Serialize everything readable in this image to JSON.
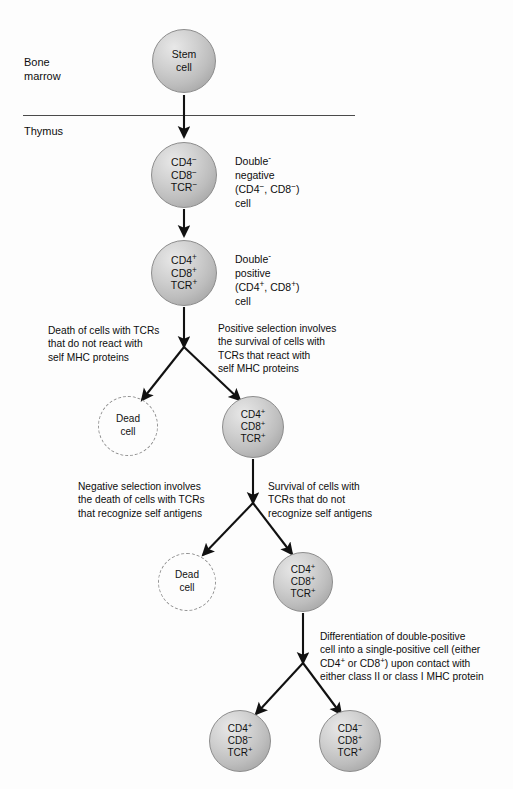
{
  "diagram": {
    "regions": [
      {
        "name": "bone-marrow",
        "label": "Bone\nmarrow"
      },
      {
        "name": "thymus",
        "label": "Thymus"
      }
    ],
    "cells": [
      {
        "id": "stem-cell",
        "name": "stem-cell",
        "type": "sphere",
        "lines": [
          "Stem",
          "cell"
        ],
        "cx": 184,
        "cy": 61,
        "r": 32,
        "font": 10.5
      },
      {
        "id": "double-negative",
        "name": "double-negative-cell",
        "type": "sphere",
        "lines": [
          "CD4−",
          "CD8−",
          "TCR−"
        ],
        "cx": 184,
        "cy": 175,
        "r": 33,
        "font": 10.5
      },
      {
        "id": "double-positive",
        "name": "double-positive-cell",
        "type": "sphere",
        "lines": [
          "CD4+",
          "CD8+",
          "TCR+"
        ],
        "cx": 184,
        "cy": 273,
        "r": 33,
        "font": 10.5
      },
      {
        "id": "dead-cell-1",
        "name": "dead-cell-positive-selection",
        "type": "dashed",
        "lines": [
          "Dead",
          "cell"
        ],
        "cx": 128,
        "cy": 426,
        "r": 30,
        "font": 10
      },
      {
        "id": "surviving-dp-1",
        "name": "surviving-double-positive-cell-1",
        "type": "sphere",
        "lines": [
          "CD4+",
          "CD8+",
          "TCR+"
        ],
        "cx": 253,
        "cy": 427,
        "r": 31,
        "font": 10
      },
      {
        "id": "dead-cell-2",
        "name": "dead-cell-negative-selection",
        "type": "dashed",
        "lines": [
          "Dead",
          "cell"
        ],
        "cx": 187,
        "cy": 582,
        "r": 29,
        "font": 10
      },
      {
        "id": "surviving-dp-2",
        "name": "surviving-double-positive-cell-2",
        "type": "sphere",
        "lines": [
          "CD4+",
          "CD8+",
          "TCR+"
        ],
        "cx": 303,
        "cy": 582,
        "r": 30,
        "font": 10
      },
      {
        "id": "single-positive-cd4",
        "name": "single-positive-cd4-cell",
        "type": "sphere",
        "lines": [
          "CD4+",
          "CD8−",
          "TCR+"
        ],
        "cx": 240,
        "cy": 741,
        "r": 31,
        "font": 10
      },
      {
        "id": "single-positive-cd8",
        "name": "single-positive-cd8-cell",
        "type": "sphere",
        "lines": [
          "CD4−",
          "CD8+",
          "TCR+"
        ],
        "cx": 350,
        "cy": 741,
        "r": 31,
        "font": 10
      }
    ],
    "annotations": [
      {
        "id": "double-negative-label",
        "name": "double-negative-annotation",
        "text": "Double-\nnegative\n(CD4−, CD8−)\ncell",
        "x": 235,
        "y": 155,
        "font": 10.5,
        "align": "left"
      },
      {
        "id": "double-positive-label",
        "name": "double-positive-annotation",
        "text": "Double-\npositive\n(CD4+, CD8+)\ncell",
        "x": 235,
        "y": 253,
        "font": 10.5,
        "align": "left"
      },
      {
        "id": "death-no-react-label",
        "name": "death-of-cells-annotation",
        "text": "Death of cells with TCRs\nthat do not react with\nself MHC proteins",
        "x": 48,
        "y": 324,
        "font": 10.2,
        "align": "left"
      },
      {
        "id": "positive-selection-label",
        "name": "positive-selection-annotation",
        "text": "Positive selection involves\nthe survival of cells with\nTCRs that react with\nself MHC proteins",
        "x": 218,
        "y": 322,
        "font": 10.2,
        "align": "left"
      },
      {
        "id": "negative-selection-label",
        "name": "negative-selection-annotation",
        "text": "Negative selection involves\nthe death of cells with TCRs\nthat recognize self antigens",
        "x": 78,
        "y": 480,
        "font": 10.2,
        "align": "left"
      },
      {
        "id": "survival-no-recognize-label",
        "name": "survival-of-cells-annotation",
        "text": "Survival of cells with\nTCRs that do not\nrecognize self antigens",
        "x": 268,
        "y": 480,
        "font": 10.2,
        "align": "left"
      },
      {
        "id": "differentiation-label",
        "name": "differentiation-annotation",
        "text": "Differentiation of double-positive\ncell into a single-positive cell (either\nCD4+ or CD8+) upon contact with\neither class II or class I MHC protein",
        "x": 320,
        "y": 630,
        "font": 10.2,
        "align": "left"
      }
    ],
    "divider": {
      "name": "bone-marrow-thymus-divider",
      "x": 23,
      "y": 115,
      "width": 332
    },
    "colors": {
      "cell_fill_light": "#e8e8e8",
      "cell_fill_dark": "#9a9a9a",
      "cell_stroke": "#8c8c8c",
      "dead_cell_stroke": "#8f8f8f",
      "arrow": "#111111",
      "text": "#0d0d0d",
      "divider": "#4a4a4a",
      "background": "#fdfdfd"
    },
    "arrows": [
      {
        "name": "arrow-stem-to-dn",
        "path": "M184,95 L184,137"
      },
      {
        "name": "arrow-dn-to-dp",
        "path": "M184,209 L184,236"
      },
      {
        "name": "arrow-dp-to-branch1",
        "path": "M184,307 L184,347"
      },
      {
        "name": "arrow-branch1-left-dead",
        "path": "M184,347 L142,400"
      },
      {
        "name": "arrow-branch1-right-survive",
        "path": "M184,347 L240,400"
      },
      {
        "name": "arrow-dp1-to-branch2",
        "path": "M253,459 L253,503"
      },
      {
        "name": "arrow-branch2-left-dead",
        "path": "M253,503 L203,555"
      },
      {
        "name": "arrow-branch2-right-survive",
        "path": "M253,503 L292,554"
      },
      {
        "name": "arrow-dp2-to-branch3",
        "path": "M303,613 L303,663"
      },
      {
        "name": "arrow-branch3-left-cd4",
        "path": "M303,663 L256,714"
      },
      {
        "name": "arrow-branch3-right-cd8",
        "path": "M303,663 L341,714"
      }
    ]
  }
}
